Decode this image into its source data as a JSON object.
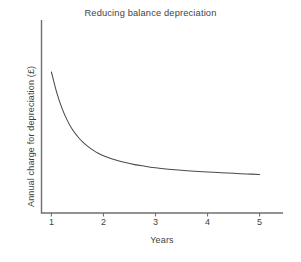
{
  "chart_data": {
    "type": "line",
    "title": "Reducing balance depreciation",
    "xlabel": "Years",
    "ylabel": "Annual charge for depreciation (£)",
    "grid": false,
    "legend": null,
    "xlim": [
      0.8,
      5.45
    ],
    "ylim": [
      0,
      100
    ],
    "xticks": [
      1,
      2,
      3,
      4,
      5
    ],
    "xtick_labels": [
      "1",
      "2",
      "3",
      "4",
      "5"
    ],
    "yticks": [],
    "ytick_labels": [],
    "line_color": "#4a4a4a",
    "axis_color": "#6f6f6f",
    "text_color": "#3f3f3f",
    "background": "#ffffff",
    "series": [
      {
        "name": "Reducing balance charge",
        "x": [
          1.0,
          1.1,
          1.2,
          1.3,
          1.4,
          1.5,
          1.6,
          1.7,
          1.8,
          1.9,
          2.0,
          2.2,
          2.4,
          2.6,
          2.8,
          3.0,
          3.25,
          3.5,
          3.75,
          4.0,
          4.25,
          4.5,
          4.75,
          5.0
        ],
        "values": [
          100.0,
          84.0,
          71.5,
          62.0,
          54.5,
          49.0,
          44.5,
          41.0,
          38.0,
          35.5,
          33.5,
          30.5,
          28.3,
          26.5,
          25.2,
          24.0,
          22.9,
          22.0,
          21.3,
          20.7,
          20.1,
          19.6,
          19.1,
          18.7
        ]
      }
    ]
  },
  "axes": {
    "x_axis_name": "x-axis-line",
    "y_axis_name": "y-axis-line"
  }
}
